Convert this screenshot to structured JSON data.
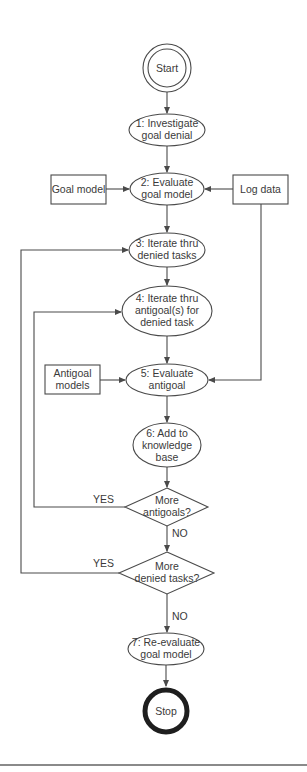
{
  "diagram": {
    "type": "flowchart",
    "terminals": {
      "start": "Start",
      "stop": "Stop"
    },
    "steps": [
      {
        "id": 1,
        "lines": [
          "1: Investigate",
          "goal denial"
        ]
      },
      {
        "id": 2,
        "lines": [
          "2: Evaluate",
          "goal model"
        ]
      },
      {
        "id": 3,
        "lines": [
          "3: Iterate thru",
          "denied tasks"
        ]
      },
      {
        "id": 4,
        "lines": [
          "4: Iterate thru",
          "antigoal(s) for",
          "denied task"
        ]
      },
      {
        "id": 5,
        "lines": [
          "5: Evaluate",
          "antigoal"
        ]
      },
      {
        "id": 6,
        "lines": [
          "6: Add to",
          "knowledge",
          "base"
        ]
      },
      {
        "id": 7,
        "lines": [
          "7: Re-evaluate",
          "goal model"
        ]
      }
    ],
    "inputs": {
      "goal_model": [
        "Goal model"
      ],
      "log_data": [
        "Log data"
      ],
      "antigoal_models": [
        "Antigoal",
        "models"
      ]
    },
    "decisions": [
      {
        "lines": [
          "More",
          "antigoals?"
        ],
        "yes": "YES",
        "no": "NO"
      },
      {
        "lines": [
          "More",
          "denied tasks?"
        ],
        "yes": "YES",
        "no": "NO"
      }
    ],
    "colors": {
      "stroke": "#4a4a4a",
      "text": "#3a3a3a",
      "background": "#ffffff"
    }
  }
}
